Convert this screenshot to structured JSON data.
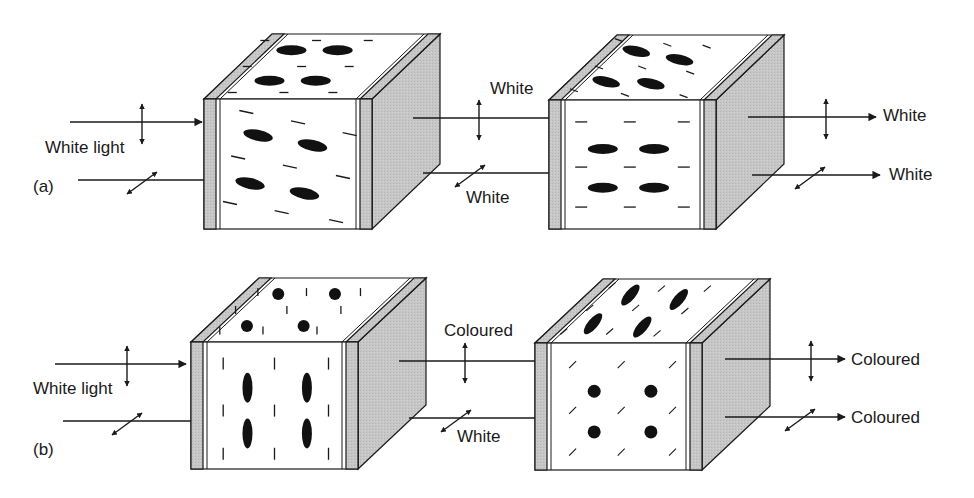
{
  "colors": {
    "line": "#1a1a1a",
    "plate": "#c8c8c8",
    "side": "#c4c4c4",
    "cell": "#ffffff",
    "molecule": "#111111"
  },
  "panels": [
    {
      "id": "a",
      "label": "(a)",
      "label_pos": [
        33,
        190
      ],
      "cubes": [
        {
          "front": [
            204,
            99,
            372,
            229
          ],
          "depth": [
            68,
            -65
          ],
          "front_mode": "tilted",
          "top_mode": "flat"
        },
        {
          "front": [
            549,
            100,
            716,
            229
          ],
          "depth": [
            68,
            -65
          ],
          "front_mode": "flat",
          "top_mode": "tilted"
        }
      ],
      "beams": [
        {
          "x1": 70,
          "x2": 202,
          "y": 122,
          "arrowhead": true,
          "pol": "vertical",
          "pol_x": 142
        },
        {
          "x1": 78,
          "x2": 204,
          "y": 180,
          "arrowhead": false,
          "pol": "diagonal",
          "pol_x": 142
        },
        {
          "x1": 413,
          "x2": 549,
          "y": 118,
          "arrowhead": false,
          "pol": "vertical",
          "pol_x": 479
        },
        {
          "x1": 423,
          "x2": 549,
          "y": 173,
          "arrowhead": false,
          "pol": "diagonal",
          "pol_x": 470
        },
        {
          "x1": 748,
          "x2": 876,
          "y": 117,
          "arrowhead": true,
          "pol": "vertical",
          "pol_x": 826
        },
        {
          "x1": 752,
          "x2": 880,
          "y": 175,
          "arrowhead": true,
          "pol": "diagonal",
          "pol_x": 810
        }
      ],
      "texts": [
        {
          "text": "White light",
          "x": 45,
          "y": 139
        },
        {
          "text": "White",
          "x": 490,
          "y": 80
        },
        {
          "text": "White",
          "x": 466,
          "y": 189
        },
        {
          "text": "White",
          "x": 883,
          "y": 107
        },
        {
          "text": "White",
          "x": 889,
          "y": 166
        }
      ]
    },
    {
      "id": "b",
      "label": "(b)",
      "label_pos": [
        33,
        453
      ],
      "cubes": [
        {
          "front": [
            191,
            342,
            358,
            469
          ],
          "depth": [
            68,
            -64
          ],
          "front_mode": "vertical",
          "top_mode": "dots"
        },
        {
          "front": [
            535,
            343,
            702,
            470
          ],
          "depth": [
            68,
            -64
          ],
          "front_mode": "dots",
          "top_mode": "diag"
        }
      ],
      "beams": [
        {
          "x1": 55,
          "x2": 186,
          "y": 364,
          "arrowhead": true,
          "pol": "vertical",
          "pol_x": 127
        },
        {
          "x1": 63,
          "x2": 191,
          "y": 421,
          "arrowhead": false,
          "pol": "diagonal",
          "pol_x": 127
        },
        {
          "x1": 399,
          "x2": 535,
          "y": 361,
          "arrowhead": false,
          "pol": "vertical",
          "pol_x": 465
        },
        {
          "x1": 409,
          "x2": 535,
          "y": 418,
          "arrowhead": false,
          "pol": "diagonal",
          "pol_x": 456
        },
        {
          "x1": 725,
          "x2": 845,
          "y": 359,
          "arrowhead": true,
          "pol": "vertical",
          "pol_x": 811
        },
        {
          "x1": 725,
          "x2": 845,
          "y": 417,
          "arrowhead": true,
          "pol": "diagonal",
          "pol_x": 800
        }
      ],
      "texts": [
        {
          "text": "White light",
          "x": 33,
          "y": 380
        },
        {
          "text": "Coloured",
          "x": 444,
          "y": 322
        },
        {
          "text": "White",
          "x": 457,
          "y": 428
        },
        {
          "text": "Coloured",
          "x": 851,
          "y": 351
        },
        {
          "text": "Coloured",
          "x": 851,
          "y": 409
        }
      ]
    }
  ]
}
